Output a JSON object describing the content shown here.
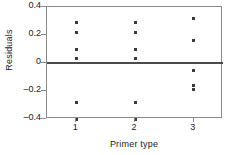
{
  "chart_data": {
    "type": "scatter",
    "title": "",
    "xlabel": "Primer type",
    "ylabel": "Residuals",
    "xlim": [
      0.5,
      3.5
    ],
    "ylim": [
      -0.4,
      0.4
    ],
    "xticks": [
      "1",
      "2",
      "3"
    ],
    "xtick_values": [
      1,
      2,
      3
    ],
    "yticks": [
      "0.4",
      "0.2",
      "0",
      "–0.2",
      "–0.4"
    ],
    "ytick_values": [
      0.4,
      0.2,
      0,
      -0.2,
      -0.4
    ],
    "grid": false,
    "legend": false,
    "reference_line": {
      "y": 0,
      "color": "#4a4a4a"
    },
    "marker": {
      "shape": "square",
      "color": "#3a3a3a",
      "size": 3
    },
    "frame_color": "#8a8a8a",
    "series": [
      {
        "name": "Primer type 1",
        "x": [
          1,
          1,
          1,
          1,
          1,
          1
        ],
        "values": [
          0.29,
          0.22,
          0.1,
          0.03,
          -0.28,
          -0.4
        ]
      },
      {
        "name": "Primer type 2",
        "x": [
          2,
          2,
          2,
          2,
          2,
          2
        ],
        "values": [
          0.29,
          0.22,
          0.1,
          0.03,
          -0.28,
          -0.4
        ]
      },
      {
        "name": "Primer type 3",
        "x": [
          3,
          3,
          3,
          3,
          3
        ],
        "values": [
          0.32,
          0.16,
          -0.05,
          -0.16,
          -0.19
        ]
      }
    ]
  }
}
